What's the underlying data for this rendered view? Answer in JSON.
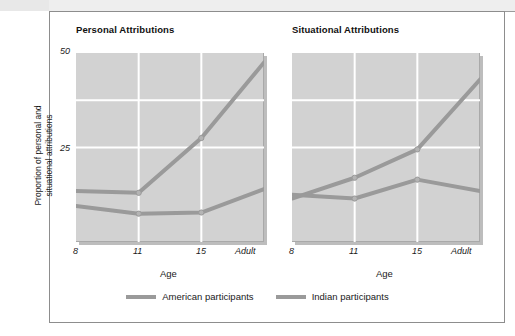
{
  "figure": {
    "ylabel_line1": "Proportion of personal and",
    "ylabel_line2": "situational attributions",
    "xlabel": "Age",
    "ytick_top": "50",
    "ytick_mid": "25"
  },
  "panels": [
    {
      "id": "personal",
      "title": "Personal Attributions"
    },
    {
      "id": "situational",
      "title": "Situational Attributions"
    }
  ],
  "xticks": [
    "8",
    "11",
    "15",
    "Adult"
  ],
  "legend": {
    "items": [
      {
        "label": "American participants",
        "color": "#9a9a9a"
      },
      {
        "label": "Indian participants",
        "color": "#9a9a9a"
      }
    ]
  },
  "colors": {
    "line": "#9a9a9a",
    "panel_background": "#d2d2d2",
    "gridline": "#ffffff",
    "frame": "#8d8d8d",
    "text": "#1a1a1a"
  },
  "chart_data": {
    "type": "line",
    "xlabel": "Age",
    "ylabel": "Proportion of personal and situational attributions",
    "categories": [
      "8",
      "11",
      "15",
      "Adult"
    ],
    "ylim": [
      0,
      50
    ],
    "yticks": [
      25,
      50
    ],
    "grid": true,
    "legend_position": "bottom-center",
    "panels": [
      {
        "title": "Personal Attributions",
        "series": [
          {
            "name": "American participants",
            "values": [
              13.5,
              13.0,
              27.5,
              47.5
            ]
          },
          {
            "name": "Indian participants",
            "values": [
              9.5,
              7.5,
              7.8,
              14.0
            ]
          }
        ]
      },
      {
        "title": "Situational Attributions",
        "series": [
          {
            "name": "American participants",
            "values": [
              11.5,
              17.0,
              24.5,
              43.0
            ]
          },
          {
            "name": "Indian participants",
            "values": [
              12.5,
              11.5,
              16.5,
              13.5
            ]
          }
        ]
      }
    ]
  }
}
